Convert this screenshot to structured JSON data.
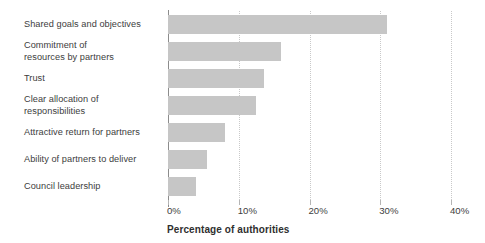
{
  "chart_data": {
    "type": "bar",
    "orientation": "horizontal",
    "title": "",
    "xlabel": "Percentage of authorities",
    "ylabel": "",
    "categories": [
      "Shared goals and objectives",
      "Commitment of\nresources by partners",
      "Trust",
      "Clear allocation of\nresponsibilities",
      "Attractive return for partners",
      "Ability of partners to deliver",
      "Council leadership"
    ],
    "values": [
      31,
      16,
      13.5,
      12.5,
      8,
      5.5,
      4
    ],
    "xlim": [
      0,
      40
    ],
    "xtick_values": [
      0,
      10,
      20,
      30,
      40
    ],
    "xtick_labels": [
      "0%",
      "10%",
      "20%",
      "30%",
      "40%"
    ],
    "grid": "vertical-dotted",
    "legend": "none",
    "bar_color": "#c6c6c6",
    "axis_color": "#8c8c8c",
    "gridline_color": "#c9c9c9",
    "text_color": "#3d3d3d"
  }
}
